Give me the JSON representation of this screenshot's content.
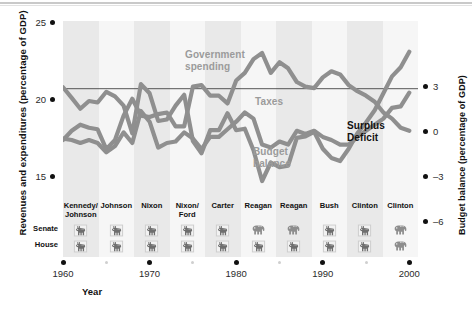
{
  "axes": {
    "left_title": "Revenues and expenditures (percentage of GDP)",
    "right_title": "Budget balance (percentage of GDP)",
    "x_title": "Year",
    "left_ticks": [
      "25",
      "20",
      "15"
    ],
    "right_ticks": [
      "3",
      "0",
      "–3",
      "–6"
    ],
    "x_major": [
      "1960",
      "1970",
      "1980",
      "1990",
      "2000"
    ],
    "x_minor": [
      "1965",
      "1975",
      "1985",
      "1995"
    ]
  },
  "series_labels": {
    "spending": "Government\nspending",
    "spending_l1": "Government",
    "spending_l2": "spending",
    "taxes": "Taxes",
    "balance_l1": "Budget",
    "balance_l2": "balance",
    "surplus": "Surplus",
    "deficit": "Deficit"
  },
  "congress": {
    "row_labels": [
      "Senate",
      "House"
    ],
    "administrations": [
      {
        "name_l1": "Kennedy/",
        "name_l2": "Johnson",
        "senate": "donkey",
        "house": "donkey"
      },
      {
        "name_l1": "Johnson",
        "name_l2": "",
        "senate": "donkey",
        "house": "donkey"
      },
      {
        "name_l1": "Nixon",
        "name_l2": "",
        "senate": "donkey",
        "house": "donkey"
      },
      {
        "name_l1": "Nixon/",
        "name_l2": "Ford",
        "senate": "donkey",
        "house": "donkey"
      },
      {
        "name_l1": "Carter",
        "name_l2": "",
        "senate": "donkey",
        "house": "donkey"
      },
      {
        "name_l1": "Reagan",
        "name_l2": "",
        "senate": "elephant",
        "house": "donkey"
      },
      {
        "name_l1": "Reagan",
        "name_l2": "",
        "senate": "elephant",
        "house": "donkey"
      },
      {
        "name_l1": "Bush",
        "name_l2": "",
        "senate": "donkey",
        "house": "donkey"
      },
      {
        "name_l1": "Clinton",
        "name_l2": "",
        "senate": "donkey",
        "house": "donkey"
      },
      {
        "name_l1": "Clinton",
        "name_l2": "",
        "senate": "elephant",
        "house": "elephant"
      }
    ]
  },
  "colors": {
    "line": "#8f8f8f",
    "line_dark": "#7d7d7d",
    "band": "#e9e9e9",
    "band_alt": "#f6f6f6",
    "text": "#111111",
    "label_gray": "#9b9b9b"
  },
  "chart_data": {
    "type": "line",
    "title": "",
    "xlabel": "Year",
    "ylabel": "Revenues and expenditures (percentage of GDP)",
    "ylabel_right": "Budget balance (percentage of GDP)",
    "xlim": [
      1960,
      2001
    ],
    "ylim": [
      13.8,
      25.6
    ],
    "ylim_right": [
      -7.3,
      4.4
    ],
    "grid": false,
    "legend": "inline-annotations",
    "yticks": [
      15,
      20,
      25
    ],
    "yticks_right": [
      -6,
      -3,
      0,
      3
    ],
    "xticks": [
      1960,
      1970,
      1980,
      1990,
      2000
    ],
    "xticks_minor": [
      1965,
      1975,
      1985,
      1995
    ],
    "x": [
      1960,
      1961,
      1962,
      1963,
      1964,
      1965,
      1966,
      1967,
      1968,
      1969,
      1970,
      1971,
      1972,
      1973,
      1974,
      1975,
      1976,
      1977,
      1978,
      1979,
      1980,
      1981,
      1982,
      1983,
      1984,
      1985,
      1986,
      1987,
      1988,
      1989,
      1990,
      1991,
      1992,
      1993,
      1994,
      1995,
      1996,
      1997,
      1998,
      1999,
      2000
    ],
    "series": [
      {
        "name": "Government spending",
        "axis": "left",
        "values": [
          17.8,
          18.4,
          18.8,
          18.6,
          18.5,
          17.2,
          17.8,
          19.4,
          20.5,
          19.4,
          19.3,
          19.5,
          19.6,
          18.7,
          18.7,
          21.3,
          21.4,
          20.7,
          20.7,
          20.2,
          21.7,
          22.2,
          23.1,
          23.5,
          22.2,
          22.9,
          22.5,
          21.6,
          21.3,
          21.2,
          21.9,
          22.3,
          22.1,
          21.4,
          21.0,
          20.7,
          20.3,
          19.6,
          19.2,
          18.6,
          18.4
        ]
      },
      {
        "name": "Taxes",
        "axis": "left",
        "values": [
          17.9,
          17.8,
          17.6,
          17.8,
          17.6,
          17.0,
          17.4,
          18.3,
          17.6,
          19.7,
          19.0,
          17.3,
          17.6,
          17.7,
          18.3,
          17.9,
          17.2,
          18.0,
          18.0,
          18.5,
          19.0,
          19.6,
          19.2,
          17.5,
          17.3,
          17.7,
          17.5,
          18.4,
          18.2,
          18.4,
          18.0,
          17.8,
          17.5,
          17.5,
          18.0,
          18.4,
          18.8,
          19.2,
          19.9,
          20.0,
          20.9
        ]
      },
      {
        "name": "Budget balance",
        "axis": "right",
        "values": [
          0.1,
          -0.6,
          -1.3,
          -0.8,
          -0.9,
          -0.2,
          -0.5,
          -1.1,
          -2.9,
          0.3,
          -0.3,
          -2.1,
          -2.0,
          -1.1,
          -0.4,
          -3.4,
          -4.2,
          -2.7,
          -2.7,
          -1.6,
          -2.7,
          -2.6,
          -4.0,
          -6.0,
          -4.8,
          -5.1,
          -5.0,
          -3.2,
          -3.1,
          -2.8,
          -3.9,
          -4.5,
          -4.7,
          -3.9,
          -2.9,
          -2.2,
          -1.4,
          -0.3,
          0.8,
          1.4,
          2.4
        ]
      }
    ]
  }
}
